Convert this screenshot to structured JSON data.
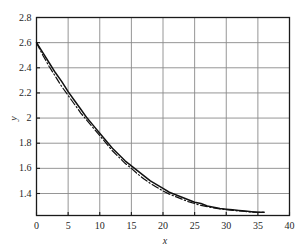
{
  "chart_data": {
    "type": "line",
    "title": "",
    "xlabel": "x",
    "ylabel": "y",
    "xlim": [
      0,
      40
    ],
    "ylim": [
      1.225,
      2.8
    ],
    "grid": true,
    "legend": "none",
    "xticks": [
      "0",
      "5",
      "10",
      "15",
      "20",
      "25",
      "30",
      "35",
      "40"
    ],
    "xtick_values": [
      0,
      5,
      10,
      15,
      20,
      25,
      30,
      35,
      40
    ],
    "yticks": [
      "1.4",
      "1.6",
      "1.8",
      "2",
      "2.2",
      "2.4",
      "2.6",
      "2.8"
    ],
    "ytick_values": [
      1.4,
      1.6,
      1.8,
      2.0,
      2.2,
      2.4,
      2.6,
      2.8
    ],
    "series": [
      {
        "name": "solid-curve",
        "style": "solid",
        "color": "#111111",
        "x": [
          0,
          1,
          2,
          3,
          4,
          5,
          6,
          7,
          8,
          9,
          10,
          11,
          12,
          13,
          14,
          15,
          16,
          17,
          18,
          19,
          20,
          21,
          22,
          23,
          24,
          25,
          26,
          27,
          28,
          29,
          30,
          31,
          32,
          33,
          34,
          35,
          36
        ],
        "y": [
          2.6,
          2.52,
          2.44,
          2.36,
          2.29,
          2.21,
          2.14,
          2.07,
          2.0,
          1.94,
          1.88,
          1.82,
          1.76,
          1.71,
          1.66,
          1.62,
          1.58,
          1.54,
          1.5,
          1.47,
          1.44,
          1.41,
          1.39,
          1.37,
          1.35,
          1.33,
          1.32,
          1.3,
          1.29,
          1.28,
          1.275,
          1.27,
          1.265,
          1.26,
          1.255,
          1.25,
          1.25
        ]
      },
      {
        "name": "dash-dot-curve",
        "style": "dash-dot",
        "color": "#111111",
        "x": [
          0,
          1,
          2,
          3,
          4,
          5,
          6,
          7,
          8,
          9,
          10,
          11,
          12,
          13,
          14,
          15,
          16,
          17,
          18,
          19,
          20,
          21,
          22,
          23,
          24,
          25,
          26,
          27,
          28,
          29,
          30,
          31,
          32,
          33,
          34,
          35,
          36
        ],
        "y": [
          2.6,
          2.5,
          2.41,
          2.33,
          2.25,
          2.18,
          2.11,
          2.04,
          1.98,
          1.92,
          1.86,
          1.8,
          1.74,
          1.69,
          1.64,
          1.6,
          1.555,
          1.515,
          1.48,
          1.45,
          1.42,
          1.395,
          1.375,
          1.355,
          1.335,
          1.32,
          1.305,
          1.295,
          1.285,
          1.278,
          1.272,
          1.266,
          1.261,
          1.257,
          1.253,
          1.25,
          1.25
        ]
      }
    ]
  },
  "axes": {
    "frame_color": "#1a1a1a",
    "grid_color": "#8a8a8a"
  }
}
